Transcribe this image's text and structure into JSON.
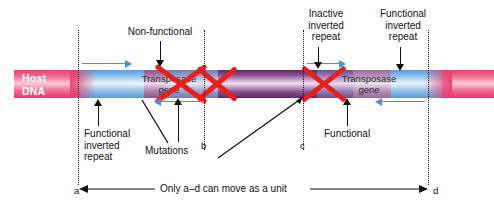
{
  "diagram": {
    "host_dna_label_line1": "Host",
    "host_dna_label_line2": "DNA",
    "genes": [
      {
        "line1": "Transposase",
        "line2": "gene",
        "state": "non-functional"
      },
      {
        "line1": "Transposase",
        "line2": "gene",
        "state": "functional"
      }
    ],
    "callouts": {
      "non_functional": "Non-functional",
      "inactive_inverted_repeat": "Inactive\ninverted\nrepeat",
      "inactive_line1": "Inactive",
      "inactive_line2": "inverted",
      "inactive_line3": "repeat",
      "functional_inverted_repeat_line1": "Functional",
      "functional_inverted_repeat_line2": "inverted",
      "functional_inverted_repeat_line3": "repeat",
      "functional_inverted_repeat_left_line1": "Functional",
      "functional_inverted_repeat_left_line2": "inverted",
      "functional_inverted_repeat_left_line3": "repeat",
      "mutations": "Mutations",
      "functional": "Functional"
    },
    "markers": {
      "a": "a",
      "b": "b",
      "c": "c",
      "d": "d"
    },
    "bottom_caption": "Only a–d can move as a unit",
    "colors": {
      "host_dna_pink": "#e8416f",
      "inverted_repeat_blue": "#5b9bd8",
      "transposase_purple": "#8a4d8f",
      "mutation_x_red": "#e8201c",
      "arrow_blue": "#4a90d9",
      "leader_black": "#111111",
      "background": "#ffffff"
    }
  }
}
